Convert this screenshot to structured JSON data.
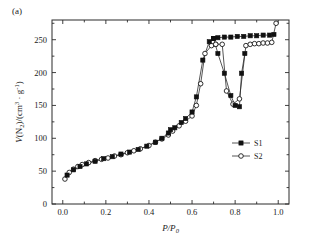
{
  "panel": {
    "label": "(a)"
  },
  "chart_data": {
    "type": "line",
    "title": "",
    "xlabel": "P/P0",
    "xlabel_parts": {
      "main": "P/P",
      "sub": "0"
    },
    "ylabel": "V(N2)/(cm3 · g-1)",
    "ylabel_parts": {
      "v": "V",
      "paren_open": "(N",
      "n_sub": "2",
      "mid": ")/(cm",
      "cm_sup": "3",
      "dot": " · g",
      "g_sup": "-1",
      "paren_close": ")"
    },
    "xlim": [
      -0.05,
      1.05
    ],
    "ylim": [
      0,
      280
    ],
    "xticks": [
      0.0,
      0.2,
      0.4,
      0.6,
      0.8,
      1.0
    ],
    "xtick_labels": [
      "0.0",
      "0.2",
      "0.4",
      "0.6",
      "0.8",
      "1.0"
    ],
    "xminor_step": 0.1,
    "yticks": [
      0,
      50,
      100,
      150,
      200,
      250
    ],
    "ytick_labels": [
      "0",
      "50",
      "100",
      "150",
      "200",
      "250"
    ],
    "yminor_step": 25,
    "grid": false,
    "legend_position": "center-right",
    "series": [
      {
        "name": "S1",
        "marker": "filled-square",
        "color": "#111111",
        "adsorption": [
          [
            0.02,
            44
          ],
          [
            0.05,
            52
          ],
          [
            0.08,
            57
          ],
          [
            0.11,
            61
          ],
          [
            0.15,
            65
          ],
          [
            0.19,
            69
          ],
          [
            0.23,
            72
          ],
          [
            0.27,
            76
          ],
          [
            0.31,
            79
          ],
          [
            0.35,
            83
          ],
          [
            0.39,
            88
          ],
          [
            0.43,
            94
          ],
          [
            0.46,
            100
          ],
          [
            0.49,
            108
          ],
          [
            0.5,
            113
          ],
          [
            0.52,
            116
          ],
          [
            0.55,
            124
          ],
          [
            0.57,
            130
          ],
          [
            0.6,
            140
          ],
          [
            0.62,
            163
          ],
          [
            0.65,
            219
          ],
          [
            0.68,
            247
          ],
          [
            0.7,
            252
          ]
        ],
        "desorption": [
          [
            0.7,
            252
          ],
          [
            0.72,
            253
          ],
          [
            0.75,
            254
          ],
          [
            0.78,
            254
          ],
          [
            0.81,
            255
          ],
          [
            0.84,
            255
          ],
          [
            0.87,
            256
          ],
          [
            0.9,
            256
          ],
          [
            0.93,
            257
          ],
          [
            0.96,
            257
          ],
          [
            0.98,
            258
          ]
        ]
      },
      {
        "name": "S2",
        "marker": "open-circle",
        "color": "#1a1a1a",
        "adsorption": [
          [
            0.01,
            38
          ],
          [
            0.03,
            48
          ],
          [
            0.05,
            53
          ],
          [
            0.07,
            57
          ],
          [
            0.09,
            60
          ],
          [
            0.12,
            63
          ],
          [
            0.15,
            66
          ],
          [
            0.18,
            68
          ],
          [
            0.21,
            70
          ],
          [
            0.24,
            73
          ],
          [
            0.27,
            75
          ],
          [
            0.3,
            78
          ],
          [
            0.33,
            81
          ],
          [
            0.36,
            84
          ],
          [
            0.4,
            89
          ],
          [
            0.43,
            94
          ],
          [
            0.46,
            99
          ],
          [
            0.49,
            105
          ],
          [
            0.51,
            111
          ],
          [
            0.54,
            119
          ],
          [
            0.57,
            126
          ],
          [
            0.6,
            134
          ],
          [
            0.62,
            150
          ],
          [
            0.64,
            183
          ],
          [
            0.66,
            229
          ],
          [
            0.69,
            241
          ],
          [
            0.71,
            243
          ]
        ],
        "desorption": [
          [
            0.71,
            243
          ],
          [
            0.74,
            243
          ],
          [
            0.76,
            172
          ],
          [
            0.79,
            152
          ],
          [
            0.82,
            160
          ],
          [
            0.85,
            241
          ],
          [
            0.87,
            243
          ],
          [
            0.89,
            244
          ],
          [
            0.91,
            244
          ],
          [
            0.93,
            245
          ],
          [
            0.95,
            245
          ],
          [
            0.97,
            246
          ],
          [
            0.99,
            275
          ]
        ]
      }
    ],
    "s1_hysteresis_lower": [
      [
        0.7,
        252
      ],
      [
        0.72,
        229
      ],
      [
        0.75,
        199
      ],
      [
        0.78,
        165
      ],
      [
        0.8,
        150
      ],
      [
        0.82,
        148
      ]
    ]
  },
  "legend": {
    "entries": [
      {
        "label": "S1",
        "marker": "filled-square"
      },
      {
        "label": "S2",
        "marker": "open-circle"
      }
    ]
  }
}
